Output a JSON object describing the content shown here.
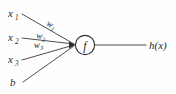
{
  "diagram": {
    "type": "artificial-neuron",
    "background_color": "#fefefe",
    "stroke_color": "#3a3a3a",
    "text_color": "#2b2b2b",
    "inputs": [
      {
        "id": "x1",
        "base": "x",
        "sub": "1",
        "x": 10,
        "y": 17
      },
      {
        "id": "x2",
        "base": "x",
        "sub": "2",
        "x": 10,
        "y": 41
      },
      {
        "id": "x3",
        "base": "x",
        "sub": "3",
        "x": 10,
        "y": 63
      },
      {
        "id": "b",
        "base": "b",
        "sub": "",
        "x": 11,
        "y": 85
      }
    ],
    "weights": [
      {
        "id": "w1",
        "base": "w",
        "sub": "1",
        "x": 46,
        "y": 25,
        "rotation": 28
      },
      {
        "id": "w2",
        "base": "w",
        "sub": "2",
        "x": 38,
        "y": 38,
        "rotation": 12
      },
      {
        "id": "w3",
        "base": "w",
        "sub": "3",
        "x": 36,
        "y": 47,
        "rotation": -4
      }
    ],
    "node": {
      "label": "f",
      "cx": 85,
      "cy": 45,
      "r": 10
    },
    "output": {
      "label": "h(x)",
      "x": 150,
      "y": 49,
      "line_start_x": 95,
      "line_end_x": 146,
      "line_y": 45
    },
    "edges": [
      {
        "from": "x1",
        "x1": 22,
        "y1": 14,
        "x2": 75,
        "y2": 44
      },
      {
        "from": "x2",
        "x1": 22,
        "y1": 38,
        "x2": 75,
        "y2": 44
      },
      {
        "from": "x3",
        "x1": 22,
        "y1": 60,
        "x2": 75,
        "y2": 45
      },
      {
        "from": "b",
        "x1": 23,
        "y1": 82,
        "x2": 75,
        "y2": 46
      }
    ]
  }
}
